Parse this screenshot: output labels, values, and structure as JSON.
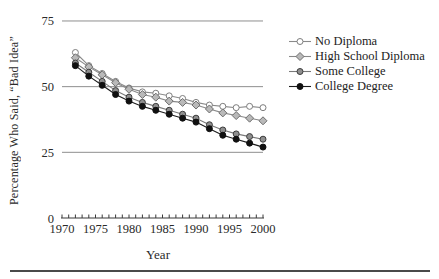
{
  "figure": {
    "y_axis_title": "Percentage Who Said, “Bad Idea”",
    "x_axis_title": "Year"
  },
  "chart_data": {
    "type": "line",
    "title": "",
    "xlabel": "Year",
    "ylabel": "Percentage Who Said, “Bad Idea”",
    "xlim": [
      1970,
      2000
    ],
    "ylim": [
      0,
      75
    ],
    "yticks": [
      0,
      25,
      50,
      75
    ],
    "xticks_labeled": [
      1970,
      1975,
      1980,
      1985,
      1990,
      1995,
      2000
    ],
    "xtick_minor_step": 1,
    "grid": "horizontal",
    "legend_position": "right",
    "x": [
      1972,
      1974,
      1976,
      1978,
      1980,
      1982,
      1984,
      1986,
      1988,
      1990,
      1992,
      1994,
      1996,
      1998,
      2000
    ],
    "series": [
      {
        "name": "No Diploma",
        "marker": "open-circle",
        "line_color": "#8a8a8a",
        "marker_fill": "#ffffff",
        "marker_stroke": "#7d7d7d",
        "values": [
          63,
          58,
          55,
          52,
          49.5,
          48,
          47.5,
          46.5,
          45.5,
          44,
          43,
          42.5,
          42,
          42.5,
          42
        ]
      },
      {
        "name": "High School Diploma",
        "marker": "diamond",
        "line_color": "#8a8a8a",
        "marker_fill": "#b9b9b9",
        "marker_stroke": "#6e6e6e",
        "values": [
          61,
          57.5,
          54.5,
          51.5,
          49,
          47,
          46,
          44.5,
          44,
          43,
          41.5,
          40,
          39,
          38,
          37
        ]
      },
      {
        "name": "Some College",
        "marker": "filled-circle",
        "line_color": "#7a7a7a",
        "marker_fill": "#8f8f8f",
        "marker_stroke": "#3c3c3c",
        "values": [
          59,
          55.5,
          52,
          48.5,
          46,
          44,
          42.5,
          41,
          39.5,
          38,
          35.5,
          33.5,
          32,
          31,
          30
        ]
      },
      {
        "name": "College Degree",
        "marker": "filled-circle",
        "line_color": "#1c1c1c",
        "marker_fill": "#101010",
        "marker_stroke": "#101010",
        "values": [
          58,
          54,
          50.5,
          47,
          44.5,
          42.5,
          41,
          39.5,
          38,
          36.5,
          34,
          31.5,
          30,
          28.5,
          27
        ]
      }
    ],
    "axis_color": "#3a3a3a",
    "grid_color": "#8f8f8f"
  }
}
